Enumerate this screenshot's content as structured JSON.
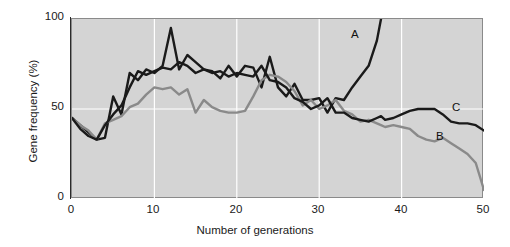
{
  "chart_data": {
    "type": "line",
    "title": "",
    "xlabel": "Number of generations",
    "ylabel": "Gene frequency (%)",
    "xlim": [
      0,
      50
    ],
    "ylim": [
      0,
      100
    ],
    "xticks": [
      0,
      10,
      20,
      30,
      40,
      50
    ],
    "yticks": [
      0,
      50,
      100
    ],
    "grid": true,
    "grid_color": "#ffffff",
    "plot_background": "#d4d4d4",
    "legend": "inline-labels",
    "x": [
      0,
      1,
      2,
      3,
      4,
      5,
      6,
      7,
      8,
      9,
      10,
      11,
      12,
      13,
      14,
      15,
      16,
      17,
      18,
      19,
      20,
      21,
      22,
      23,
      24,
      25,
      26,
      27,
      28,
      29,
      30,
      31,
      32,
      33,
      34,
      35,
      36,
      37,
      37.5,
      38,
      39,
      40,
      41,
      42,
      43,
      44,
      45,
      46,
      47,
      48,
      49,
      50
    ],
    "series": [
      {
        "name": "A",
        "label": "A",
        "color": "#1a1a1a",
        "line_width": 2.4,
        "ends_at_generation": 37.5,
        "values": [
          45,
          41,
          37,
          33,
          34,
          57,
          47,
          70,
          66,
          72,
          70,
          74,
          95,
          72,
          80,
          76,
          72,
          71,
          67,
          74,
          68,
          74,
          73,
          62,
          79,
          62,
          57,
          64,
          55,
          55,
          56,
          48,
          56,
          55,
          62,
          68,
          74,
          88,
          100,
          null,
          null,
          null,
          null,
          null,
          null,
          null,
          null,
          null,
          null,
          null,
          null,
          null
        ]
      },
      {
        "name": "B",
        "label": "B",
        "color": "#8a8a8a",
        "line_width": 2.4,
        "values": [
          45,
          41,
          38,
          33,
          42,
          44,
          46,
          51,
          53,
          58,
          62,
          61,
          62,
          58,
          61,
          48,
          55,
          51,
          49,
          48,
          48,
          49,
          57,
          66,
          69,
          68,
          65,
          60,
          52,
          55,
          50,
          52,
          55,
          49,
          47,
          43,
          44,
          42,
          41,
          40,
          41,
          40,
          39,
          35,
          33,
          32,
          34,
          31,
          28,
          25,
          20,
          5
        ]
      },
      {
        "name": "C",
        "label": "C",
        "color": "#1a1a1a",
        "line_width": 2.4,
        "values": [
          45,
          39,
          35,
          33,
          41,
          47,
          52,
          62,
          71,
          69,
          71,
          73,
          72,
          76,
          74,
          70,
          72,
          70,
          71,
          68,
          70,
          69,
          68,
          74,
          66,
          65,
          62,
          56,
          54,
          50,
          52,
          56,
          48,
          48,
          45,
          44,
          43,
          45,
          46,
          44,
          45,
          47,
          49,
          50,
          50,
          50,
          47,
          43,
          42,
          42,
          41,
          38
        ]
      }
    ]
  },
  "axes": {
    "y_labels": {
      "top": "100",
      "middle": "50",
      "bottom": "0"
    },
    "x_labels": [
      "0",
      "10",
      "20",
      "30",
      "40",
      "50"
    ],
    "x_title": "Number of generations",
    "y_title": "Gene frequency (%)"
  },
  "series_labels": {
    "a": "A",
    "b": "B",
    "c": "C"
  }
}
